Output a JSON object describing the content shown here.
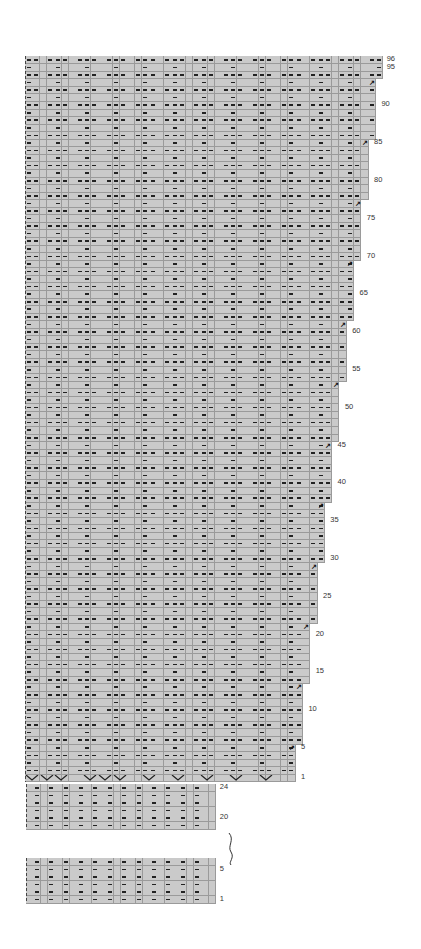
{
  "chart": {
    "title": "",
    "cell_w": 7.3,
    "cell_h": 7.56,
    "fill_color": "#cacaca",
    "grid_color": "#9a9a9a",
    "symbol_color": "#222222",
    "main": {
      "rows": 96,
      "base_width_sts": 37,
      "max_width_sts": 49,
      "decrease_rows": [
        5,
        13,
        21,
        29,
        37,
        45,
        53,
        61,
        69,
        77,
        85,
        93
      ],
      "pattern_repeat": 4,
      "pattern_odd_rows": "ppp.",
      "pattern_even_rows": ".p..",
      "increase_row_symbol": "chevron",
      "increase_columns": [
        0,
        2,
        4,
        8,
        10,
        12,
        16,
        20,
        24,
        28,
        32
      ],
      "row_labels": [
        "1",
        "5",
        "10",
        "15",
        "20",
        "25",
        "30",
        "35",
        "40",
        "45",
        "50",
        "55",
        "60",
        "65",
        "70",
        "75",
        "80",
        "85",
        "90",
        "95",
        "96"
      ]
    },
    "ribbing_top": {
      "rows": 6,
      "first_row_number": 19,
      "last_row_number": 24,
      "width_sts": 26,
      "pattern": ".p",
      "row_labels": [
        "24",
        "20"
      ]
    },
    "ribbing_bottom": {
      "rows": 6,
      "first_row_number": 1,
      "last_row_number": 6,
      "width_sts": 26,
      "pattern": ".p",
      "row_labels": [
        "5",
        "1"
      ]
    },
    "break_symbol": "wavy-line"
  }
}
